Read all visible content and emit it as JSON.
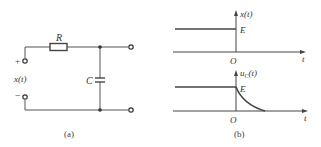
{
  "circuit": {
    "caption": "(a)",
    "resistor_label": "R",
    "capacitor_label": "C",
    "input_label": "x(t)",
    "plus_sign": "+",
    "minus_sign": "−"
  },
  "graphs": {
    "caption": "(b)",
    "top": {
      "y_label": "x(t)",
      "level_label": "E",
      "origin_label": "O",
      "x_label": "t"
    },
    "bottom": {
      "y_label_main": "u",
      "y_label_sub": "C",
      "y_label_tail": "(t)",
      "level_label": "E",
      "origin_label": "O",
      "x_label": "t"
    }
  },
  "colors": {
    "line": "#444444",
    "text": "#333333",
    "background": "#ffffff"
  }
}
